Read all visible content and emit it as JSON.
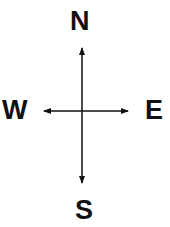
{
  "diagram": {
    "type": "compass-directions",
    "labels": {
      "north": "N",
      "south": "S",
      "east": "E",
      "west": "W"
    },
    "colors": {
      "ink": "#111111",
      "background": "#ffffff"
    }
  }
}
